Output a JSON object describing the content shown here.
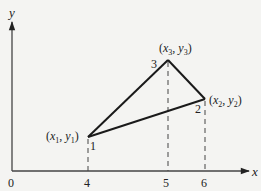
{
  "diagram": {
    "axes": {
      "x_label": "x",
      "y_label": "y",
      "origin_label": "0",
      "x_ticks": [
        "4",
        "5",
        "6"
      ]
    },
    "nodes": [
      {
        "id": "1",
        "number_label": "1",
        "coord_label_x": "x",
        "coord_sub_x": "1",
        "coord_label_y": "y",
        "coord_sub_y": "1",
        "x_value": 4
      },
      {
        "id": "2",
        "number_label": "2",
        "coord_label_x": "x",
        "coord_sub_x": "2",
        "coord_label_y": "y",
        "coord_sub_y": "2",
        "x_value": 6
      },
      {
        "id": "3",
        "number_label": "3",
        "coord_label_x": "x",
        "coord_sub_x": "3",
        "coord_label_y": "y",
        "coord_sub_y": "3",
        "x_value": 5
      }
    ],
    "edges": [
      [
        "1",
        "3"
      ],
      [
        "3",
        "2"
      ],
      [
        "2",
        "1"
      ]
    ],
    "colors": {
      "background": "#f4f4f2",
      "line": "#222222",
      "axis": "#333333",
      "dashed": "#333333"
    }
  }
}
